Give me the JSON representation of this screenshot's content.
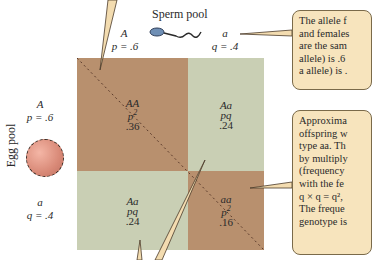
{
  "sperm_pool": {
    "title": "Sperm pool",
    "allele_A": {
      "symbol": "A",
      "freq_label": "p = .6"
    },
    "allele_a": {
      "symbol": "a",
      "freq_label": "q = .4"
    }
  },
  "egg_pool": {
    "title": "Egg pool",
    "allele_A": {
      "symbol": "A",
      "freq_label": "p = .6"
    },
    "allele_a": {
      "symbol": "a",
      "freq_label": "q = .4"
    }
  },
  "punnett": {
    "cells": [
      {
        "genotype": "AA",
        "formula": "p",
        "exp": "2",
        "value": ".36",
        "color": "#b8906e"
      },
      {
        "genotype": "Aa",
        "formula": "pq",
        "exp": "",
        "value": ".24",
        "color": "#c9cfb4"
      },
      {
        "genotype": "Aa",
        "formula": "pq",
        "exp": "",
        "value": ".24",
        "color": "#c9cfb4"
      },
      {
        "genotype": "aa",
        "formula": "p",
        "exp": "2",
        "value": ".16",
        "color": "#b8906e"
      }
    ]
  },
  "callouts": {
    "top": {
      "lines": [
        "The allele f",
        "and females",
        "are the sam",
        "allele) is .6",
        "a allele) is ."
      ]
    },
    "bottom": {
      "lines": [
        "Approxima",
        "offspring w",
        "type aa. Th",
        "by multiply",
        "(frequency",
        "with the fe",
        "q × q = q², ",
        "The freque",
        "genotype is"
      ]
    }
  },
  "colors": {
    "homozygous_cell": "#b8906e",
    "heterozygous_cell": "#c9cfb4",
    "callout_fill": "#f7e4bd",
    "egg": "#d98a78"
  }
}
